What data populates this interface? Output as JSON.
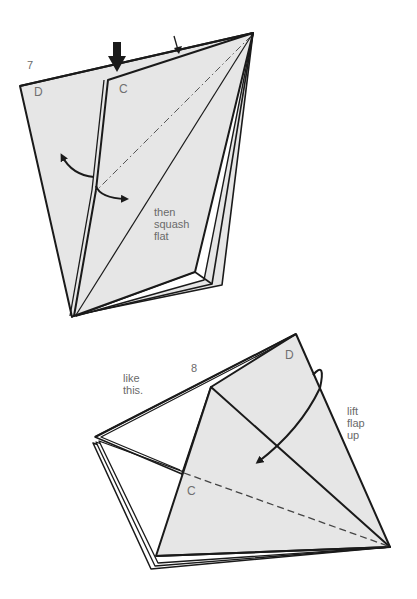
{
  "colors": {
    "paper": "#e6e6e6",
    "line": "#1a1a1a",
    "text": "#6a6a6a",
    "background": "#ffffff"
  },
  "step7": {
    "number": "7",
    "flap_labels": {
      "d": "D",
      "c": "C"
    },
    "instruction": "then\nsquash\nflat",
    "arrows": [
      "push-down-arrow",
      "small-down-arrow",
      "open-flap-curved-arrow",
      "squash-curved-arrow"
    ],
    "fold_lines": [
      "dash-dot mountain line"
    ]
  },
  "step8": {
    "number": "8",
    "caption": "like\nthis.",
    "flap_labels": {
      "d": "D",
      "c": "C"
    },
    "instruction": "lift\nflap\nup",
    "arrows": [
      "lift-flap-curved-arrow"
    ],
    "fold_lines": [
      "dashed valley line"
    ]
  }
}
